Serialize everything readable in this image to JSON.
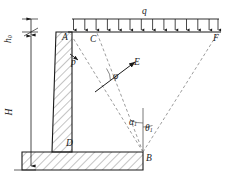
{
  "figure": {
    "type": "retaining-wall-cross-section",
    "line_color": "#1a1a1a",
    "hatch_color": "#555555",
    "dash_color": "#8a8a8a"
  },
  "labels": {
    "point_A": "A",
    "point_B": "B",
    "point_C": "C",
    "point_D": "D",
    "point_E": "E",
    "point_F": "F",
    "load_q": "q",
    "pressure_p": "p",
    "angle_phi": "φ",
    "angle_alpha": "α",
    "angle_alpha_sub": "1",
    "angle_theta": "θ",
    "angle_theta_sub": "1",
    "height_H": "H",
    "height_h0": "h",
    "height_h0_sub": "0"
  },
  "geometry": {
    "surcharge_arrow_count": 14,
    "surcharge_left_x": 72,
    "surcharge_right_x": 219,
    "surcharge_rail_y": 19,
    "surcharge_tip_y": 31,
    "wall_top_y": 32,
    "wall_base_y": 152,
    "footing_bottom_y": 170,
    "footing_left_x": 22,
    "footing_right_x": 143,
    "stem_top_left_x": 56,
    "stem_top_right_x": 72,
    "stem_bottom_left_x": 52,
    "stem_bottom_right_x": 72,
    "point_B_x": 143,
    "point_B_y": 152,
    "point_C_x": 96,
    "point_F_x": 219
  }
}
